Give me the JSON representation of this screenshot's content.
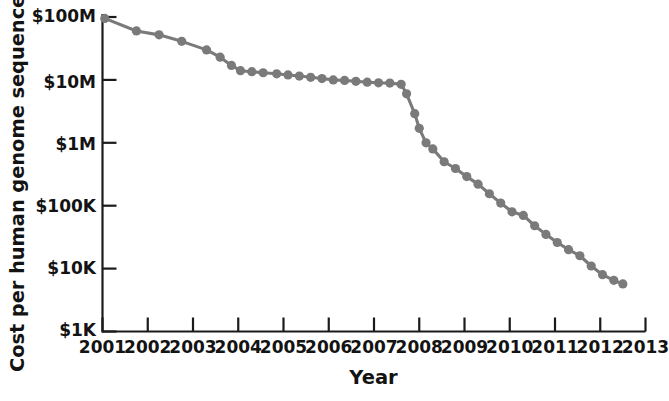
{
  "chart_data": {
    "type": "line",
    "title": "",
    "xlabel": "Year",
    "ylabel": "Cost per human genome sequenced",
    "yscale": "log",
    "ylim": [
      1000,
      100000000
    ],
    "xlim": [
      2001,
      2013
    ],
    "grid": false,
    "legend": null,
    "ytick_labels": [
      "$100M",
      "$10M",
      "$1M",
      "$100K",
      "$10K",
      "$1K"
    ],
    "ytick_values": [
      100000000,
      10000000,
      1000000,
      100000,
      10000,
      1000
    ],
    "xtick_labels": [
      "2001",
      "2002",
      "2003",
      "2004",
      "2005",
      "2006",
      "2007",
      "2008",
      "2009",
      "2010",
      "2011",
      "2012",
      "2013"
    ],
    "xtick_values": [
      2001,
      2002,
      2003,
      2004,
      2005,
      2006,
      2007,
      2008,
      2009,
      2010,
      2011,
      2012,
      2013
    ],
    "series": [
      {
        "name": "Cost per human genome sequenced",
        "color": "#7a7a7a",
        "marker": "circle",
        "x": [
          2001.05,
          2001.75,
          2002.25,
          2002.75,
          2003.3,
          2003.6,
          2003.85,
          2004.05,
          2004.3,
          2004.55,
          2004.85,
          2005.1,
          2005.35,
          2005.6,
          2005.85,
          2006.1,
          2006.35,
          2006.6,
          2006.85,
          2007.1,
          2007.35,
          2007.6,
          2007.72,
          2007.9,
          2008.0,
          2008.15,
          2008.3,
          2008.55,
          2008.8,
          2009.05,
          2009.3,
          2009.55,
          2009.8,
          2010.05,
          2010.3,
          2010.55,
          2010.8,
          2011.05,
          2011.3,
          2011.55,
          2011.8,
          2012.05,
          2012.3,
          2012.5
        ],
        "y": [
          95000000,
          60000000,
          52000000,
          41000000,
          30000000,
          23000000,
          17000000,
          14000000,
          13500000,
          13000000,
          12500000,
          12000000,
          11500000,
          11000000,
          10500000,
          10000000,
          9800000,
          9500000,
          9200000,
          9000000,
          8900000,
          8500000,
          6000000,
          2900000,
          1700000,
          1000000,
          800000,
          500000,
          390000,
          290000,
          220000,
          155000,
          110000,
          80000,
          70000,
          48000,
          35000,
          26000,
          20000,
          16000,
          11000,
          8000,
          6500,
          5700
        ]
      }
    ],
    "annotations": []
  }
}
